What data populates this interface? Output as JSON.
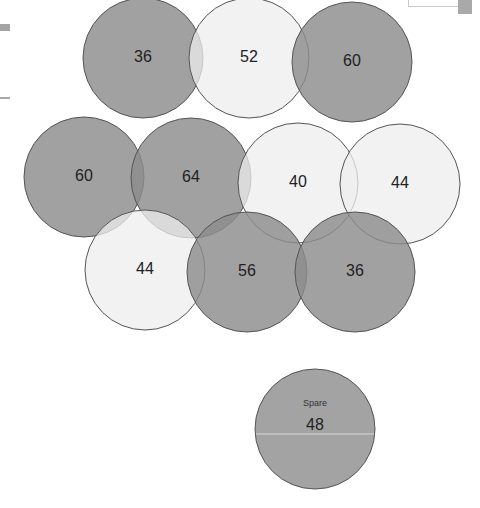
{
  "diagram": {
    "title": "",
    "colors": {
      "dark": "#8c8c8c",
      "light": "#eeeeee",
      "stroke": "#555555",
      "spare": "#a3a3a3",
      "spare_line": "#d8d8d8"
    },
    "radius": 60,
    "circles": [
      {
        "id": "c1",
        "label": "36",
        "cx": 143,
        "cy": 58,
        "tone": "dark"
      },
      {
        "id": "c2",
        "label": "52",
        "cx": 249,
        "cy": 58,
        "tone": "light"
      },
      {
        "id": "c3",
        "label": "60",
        "cx": 352,
        "cy": 62,
        "tone": "dark"
      },
      {
        "id": "c4",
        "label": "60",
        "cx": 84,
        "cy": 177,
        "tone": "dark"
      },
      {
        "id": "c5",
        "label": "64",
        "cx": 191,
        "cy": 178,
        "tone": "dark"
      },
      {
        "id": "c6",
        "label": "40",
        "cx": 298,
        "cy": 183,
        "tone": "light"
      },
      {
        "id": "c7",
        "label": "44",
        "cx": 400,
        "cy": 184,
        "tone": "light"
      },
      {
        "id": "c8",
        "label": "44",
        "cx": 145,
        "cy": 270,
        "tone": "light"
      },
      {
        "id": "c9",
        "label": "56",
        "cx": 247,
        "cy": 272,
        "tone": "dark"
      },
      {
        "id": "c10",
        "label": "36",
        "cx": 355,
        "cy": 272,
        "tone": "dark"
      }
    ],
    "spare": {
      "caption": "Spare",
      "label": "48",
      "cx": 315,
      "cy": 429
    }
  }
}
